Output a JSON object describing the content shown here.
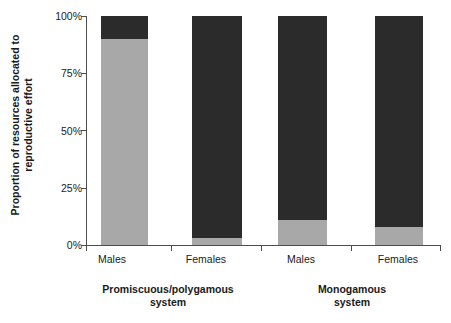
{
  "chart_data": {
    "type": "bar",
    "subtype": "stacked-percent",
    "title": "",
    "xlabel": "",
    "ylabel": "Proportion of resources allocated to reproductive effort",
    "ylabel_line1": "Proportion of resources allocated to",
    "ylabel_line2": "reproductive effort",
    "ylim": [
      0,
      100
    ],
    "yticks": [
      "0%",
      "25%",
      "50%",
      "75%",
      "100%"
    ],
    "ytick_values": [
      0,
      25,
      50,
      75,
      100
    ],
    "grid": false,
    "legend": "none",
    "categories": [
      "Males",
      "Females",
      "Males",
      "Females"
    ],
    "groups": [
      {
        "label_line1": "Promiscuous/polygamous",
        "label_line2": "system",
        "categories": [
          "Males",
          "Females"
        ]
      },
      {
        "label_line1": "Monogamous",
        "label_line2": "system",
        "categories": [
          "Males",
          "Females"
        ]
      }
    ],
    "series": [
      {
        "name": "mating-effort",
        "color": "#a8a8a8",
        "values": [
          90,
          3,
          11,
          8
        ]
      },
      {
        "name": "parental-effort",
        "color": "#2b2b2b",
        "values": [
          10,
          97,
          89,
          92
        ]
      }
    ],
    "bars": [
      {
        "category": "Males",
        "group": "Promiscuous/polygamous system",
        "light_pct": 90,
        "dark_pct": 10
      },
      {
        "category": "Females",
        "group": "Promiscuous/polygamous system",
        "light_pct": 3,
        "dark_pct": 97
      },
      {
        "category": "Males",
        "group": "Monogamous system",
        "light_pct": 11,
        "dark_pct": 89
      },
      {
        "category": "Females",
        "group": "Monogamous system",
        "light_pct": 8,
        "dark_pct": 92
      }
    ],
    "colors": {
      "light": "#a8a8a8",
      "dark": "#2b2b2b",
      "axis": "#4d4d4d",
      "text": "#1a1a1a"
    }
  }
}
